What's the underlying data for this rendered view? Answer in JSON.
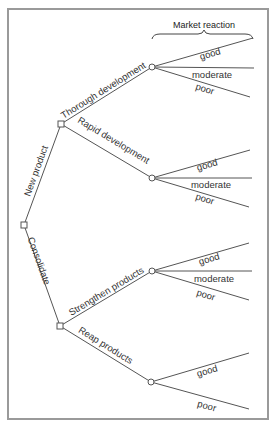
{
  "diagram": {
    "type": "decision-tree",
    "header": {
      "title": "Market reaction"
    },
    "root": {
      "node_type": "decision",
      "branches": [
        {
          "label": "New product",
          "node_type": "decision",
          "branches": [
            {
              "label": "Thorough development",
              "node_type": "chance",
              "outcomes": [
                "good",
                "moderate",
                "poor"
              ]
            },
            {
              "label": "Rapid development",
              "node_type": "chance",
              "outcomes": [
                "good",
                "moderate",
                "poor"
              ]
            }
          ]
        },
        {
          "label": "Consolidate",
          "node_type": "decision",
          "branches": [
            {
              "label": "Strengthen products",
              "node_type": "chance",
              "outcomes": [
                "good",
                "moderate",
                "poor"
              ]
            },
            {
              "label": "Reap products",
              "node_type": "chance",
              "outcomes": [
                "good",
                "poor"
              ]
            }
          ]
        }
      ]
    },
    "labels": {
      "title": "Market reaction",
      "new_product": "New product",
      "consolidate": "Consolidate",
      "thorough_development": "Thorough development",
      "rapid_development": "Rapid development",
      "strengthen_products": "Strengthen products",
      "reap_products": "Reap products",
      "good": "good",
      "moderate": "moderate",
      "poor": "poor"
    },
    "legend": {
      "decision_node_icon": "square",
      "chance_node_icon": "circle"
    },
    "colors": {
      "frame": "#9a9a9a",
      "lines": "#555555",
      "text": "#333333",
      "background": "#ffffff"
    }
  }
}
